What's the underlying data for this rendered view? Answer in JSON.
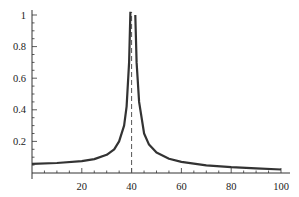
{
  "chart_data": {
    "type": "line",
    "title": "",
    "xlabel": "",
    "ylabel": "",
    "xlim": [
      0,
      100
    ],
    "ylim": [
      0,
      1.0
    ],
    "grid": false,
    "legend": null,
    "x_ticks": [
      20,
      40,
      60,
      80,
      100
    ],
    "x_tick_labels": [
      "20",
      "40",
      "60",
      "80",
      "100"
    ],
    "y_ticks": [
      0.2,
      0.4,
      0.6,
      0.8,
      1.0
    ],
    "y_tick_labels": [
      "0.2",
      "0.4",
      "0.6",
      "0.8",
      "1"
    ],
    "annotations": [
      {
        "type": "vertical-dashed-line",
        "x": 40
      }
    ],
    "series": [
      {
        "name": "response",
        "color": "#333333",
        "x": [
          0,
          10,
          20,
          25,
          30,
          33,
          35,
          37,
          38,
          39,
          39.5,
          41.5,
          42,
          43,
          45,
          47,
          50,
          55,
          60,
          70,
          80,
          90,
          100
        ],
        "values": [
          0.058,
          0.063,
          0.075,
          0.088,
          0.115,
          0.15,
          0.2,
          0.3,
          0.42,
          0.7,
          1.02,
          1.0,
          0.7,
          0.45,
          0.25,
          0.18,
          0.13,
          0.09,
          0.07,
          0.048,
          0.037,
          0.03,
          0.022
        ]
      }
    ]
  }
}
